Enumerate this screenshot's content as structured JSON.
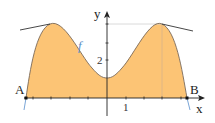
{
  "figure": {
    "type": "function-graph-with-shaded-area",
    "function_label": "f",
    "axes": {
      "x_label": "x",
      "y_label": "y",
      "x_tick_label": "1",
      "y_tick_label": "2"
    },
    "points": {
      "A": "A",
      "B": "B"
    },
    "colors": {
      "fill": "#FCC475",
      "curve": "#7A6A5A",
      "curve_tails": "#6B9BD1",
      "function_label": "#5B8FC7",
      "axis": "#222222",
      "tangent": "#333333",
      "guide": "#C8C8C8"
    },
    "features": {
      "left_peak_tangent": true,
      "right_peak_tangent": true,
      "dotted_guides_to_right_peak": true
    }
  }
}
